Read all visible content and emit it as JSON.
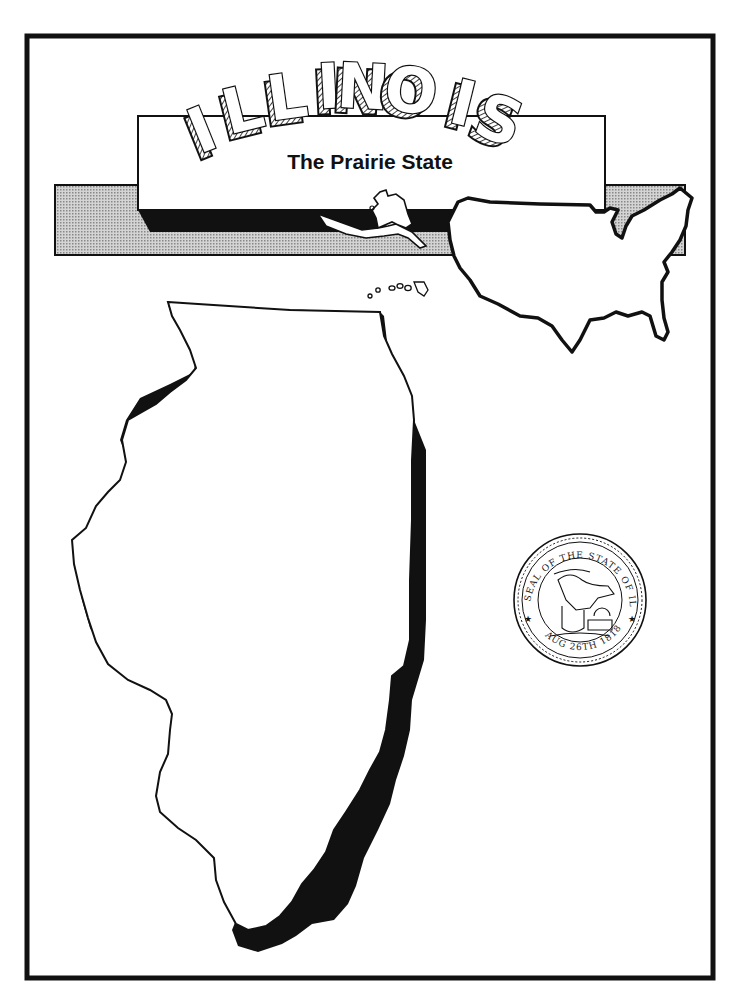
{
  "page": {
    "title": "ILLINOIS",
    "title_letters": [
      "I",
      "L",
      "L",
      "I",
      "N",
      "O",
      "I",
      "S"
    ],
    "subtitle": "The Prairie State"
  },
  "seal": {
    "top_text": "SEAL OF THE STATE OF ILLINOIS",
    "bottom_text": "AUG 26TH 1818"
  },
  "colors": {
    "ink": "#111111",
    "paper": "#ffffff",
    "banner_gray": "#b8b8b8"
  }
}
